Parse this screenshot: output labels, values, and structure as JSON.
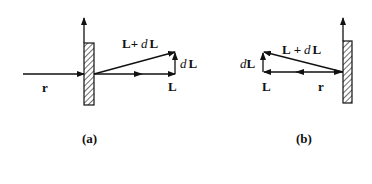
{
  "panels": [
    {
      "id": "a",
      "caption": "(a)",
      "labels": {
        "r": "r",
        "L": "L",
        "dL_d": "d",
        "dL_L": "L",
        "sum_L1": "L",
        "sum_plus": "+",
        "sum_d": "d",
        "sum_L2": "L"
      }
    },
    {
      "id": "b",
      "caption": "(b)",
      "labels": {
        "r": "r",
        "L": "L",
        "dL_d": "d",
        "dL_L": "L",
        "sum_L1": "L",
        "sum_plus": "+",
        "sum_d": "d",
        "sum_L2": "L"
      }
    }
  ],
  "colors": {
    "stroke": "#111111",
    "background": "#ffffff"
  }
}
